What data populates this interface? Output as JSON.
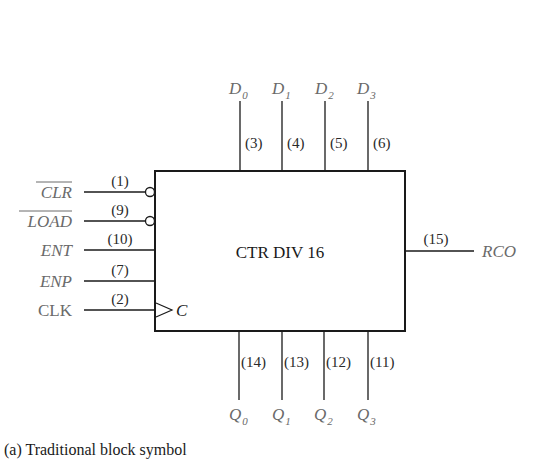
{
  "block": {
    "title": "CTR DIV 16",
    "clock_label": "C"
  },
  "inputs": [
    {
      "name": "CLR",
      "pin": "(1)",
      "active_low": true
    },
    {
      "name": "LOAD",
      "pin": "(9)",
      "active_low": true
    },
    {
      "name": "ENT",
      "pin": "(10)",
      "active_low": false
    },
    {
      "name": "ENP",
      "pin": "(7)",
      "active_low": false
    },
    {
      "name": "CLK",
      "pin": "(2)",
      "active_low": false
    }
  ],
  "data_inputs": [
    {
      "name": "D",
      "sub": "0",
      "pin": "(3)"
    },
    {
      "name": "D",
      "sub": "1",
      "pin": "(4)"
    },
    {
      "name": "D",
      "sub": "2",
      "pin": "(5)"
    },
    {
      "name": "D",
      "sub": "3",
      "pin": "(6)"
    }
  ],
  "outputs": [
    {
      "name": "Q",
      "sub": "0",
      "pin": "(14)"
    },
    {
      "name": "Q",
      "sub": "1",
      "pin": "(13)"
    },
    {
      "name": "Q",
      "sub": "2",
      "pin": "(12)"
    },
    {
      "name": "Q",
      "sub": "3",
      "pin": "(11)"
    }
  ],
  "rco": {
    "name": "RCO",
    "pin": "(15)"
  },
  "caption": "(a) Traditional block symbol"
}
